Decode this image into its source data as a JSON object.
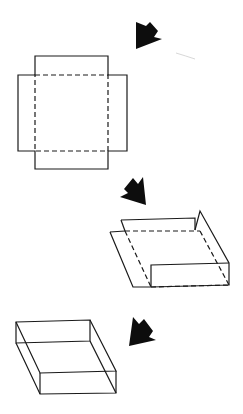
{
  "diagram": {
    "steps": [
      {
        "step": 1,
        "name": "flat-net",
        "arrow_direction": "down-left"
      },
      {
        "step": 2,
        "name": "partially-folded",
        "arrow_direction": "down-left"
      },
      {
        "step": 3,
        "name": "finished-tray",
        "arrow_direction": "down-left"
      }
    ],
    "colors": {
      "line": "#1a1a1a",
      "arrow": "#0d0d0d",
      "background": "#ffffff"
    }
  }
}
